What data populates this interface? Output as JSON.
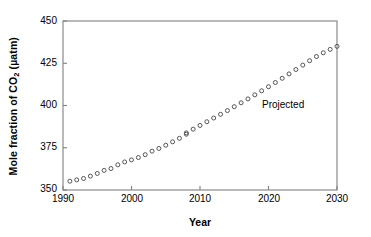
{
  "chart_data": {
    "type": "scatter",
    "title": "",
    "xlabel": "Year",
    "ylabel": "Mole fraction of CO2 (µatm)",
    "ylabel_text": "Mole fraction of CO",
    "ylabel_sub": "2",
    "ylabel_unit": " (µatm)",
    "xlim": [
      1990,
      2030
    ],
    "ylim": [
      350,
      450
    ],
    "xticks": [
      1990,
      2000,
      2010,
      2020,
      2030
    ],
    "xtick_labels": [
      "1990",
      "2000",
      "2010",
      "2020",
      "2030"
    ],
    "yticks": [
      350,
      375,
      400,
      425,
      450
    ],
    "ytick_labels": [
      "350",
      "375",
      "400",
      "425",
      "450"
    ],
    "grid": false,
    "legend": "none",
    "marker": "open-circle",
    "marker_color": "#555555",
    "annotations": [
      {
        "text": "Projected",
        "x": 2019.0,
        "y": 404.0
      }
    ],
    "series": [
      {
        "name": "Observed",
        "style": "open-circle",
        "x": [
          1991,
          1992,
          1993,
          1994,
          1995,
          1996,
          1997,
          1998,
          1999,
          2000,
          2001,
          2002,
          2003,
          2004,
          2005,
          2006,
          2007,
          2008
        ],
        "values": [
          355.2,
          356.0,
          356.8,
          358.2,
          359.8,
          361.6,
          362.7,
          364.9,
          366.6,
          367.8,
          369.2,
          370.9,
          373.0,
          374.6,
          376.5,
          378.5,
          380.6,
          383.0
        ]
      },
      {
        "name": "Projected",
        "style": "open-circle",
        "x": [
          2008,
          2009,
          2010,
          2011,
          2012,
          2013,
          2014,
          2015,
          2016,
          2017,
          2018,
          2019,
          2020,
          2021,
          2022,
          2023,
          2024,
          2025,
          2026,
          2027,
          2028,
          2029,
          2030
        ],
        "values": [
          383.8,
          386.0,
          388.2,
          390.4,
          392.6,
          394.8,
          397.0,
          399.3,
          401.6,
          403.9,
          406.3,
          408.7,
          411.1,
          413.6,
          416.1,
          418.7,
          421.3,
          423.9,
          426.5,
          429.0,
          431.2,
          433.2,
          435.0
        ]
      }
    ]
  },
  "axes": {
    "frame_color": "#808080"
  }
}
